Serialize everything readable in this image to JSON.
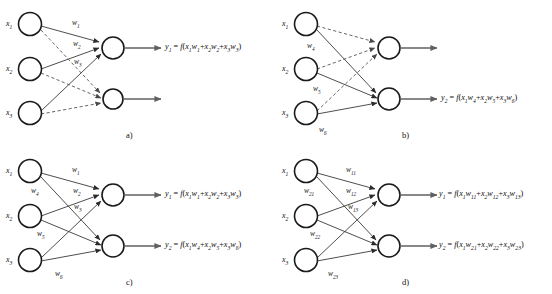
{
  "figure": {
    "background_color": "#ffffff",
    "ink_color": "#1a1a1a",
    "dashed_edge_color": "#555555",
    "solid_edge_color": "#3a3a3a",
    "output_arrow_color": "#606060"
  },
  "panels": [
    {
      "id": "a",
      "caption": "a)",
      "inputs": [
        {
          "name": "x1",
          "label": "x",
          "sub": "1"
        },
        {
          "name": "x2",
          "label": "x",
          "sub": "2"
        },
        {
          "name": "x3",
          "label": "x",
          "sub": "3"
        }
      ],
      "weights": [
        {
          "name": "w1",
          "label": "w",
          "sub": "1"
        },
        {
          "name": "w2",
          "label": "w",
          "sub": "2"
        },
        {
          "name": "w3",
          "label": "w",
          "sub": "3"
        }
      ],
      "outputs": [
        {
          "name": "y1",
          "formula_prefix": "y",
          "formula_sub": "1",
          "formula_body": " = f(x1w1+x2w2+x3w3)"
        }
      ],
      "edge_styles": {
        "to_top_node": "solid",
        "to_bottom_node": "dashed"
      }
    },
    {
      "id": "b",
      "caption": "b)",
      "inputs": [
        {
          "name": "x1",
          "label": "x",
          "sub": "1"
        },
        {
          "name": "x2",
          "label": "x",
          "sub": "2"
        },
        {
          "name": "x3",
          "label": "x",
          "sub": "3"
        }
      ],
      "weights": [
        {
          "name": "w4",
          "label": "w",
          "sub": "4"
        },
        {
          "name": "w5",
          "label": "w",
          "sub": "5"
        },
        {
          "name": "w6",
          "label": "w",
          "sub": "6"
        }
      ],
      "outputs": [
        {
          "name": "y2",
          "formula_prefix": "y",
          "formula_sub": "2",
          "formula_body": " = f(x1w4+x2w5+x3w6)"
        }
      ],
      "edge_styles": {
        "to_top_node": "dashed",
        "to_bottom_node": "solid"
      }
    },
    {
      "id": "c",
      "caption": "c)",
      "inputs": [
        {
          "name": "x1",
          "label": "x",
          "sub": "1"
        },
        {
          "name": "x2",
          "label": "x",
          "sub": "2"
        },
        {
          "name": "x3",
          "label": "x",
          "sub": "3"
        }
      ],
      "weights": [
        {
          "name": "w1",
          "label": "w",
          "sub": "1"
        },
        {
          "name": "w2",
          "label": "w",
          "sub": "2"
        },
        {
          "name": "w3",
          "label": "w",
          "sub": "3"
        },
        {
          "name": "w4",
          "label": "w",
          "sub": "4"
        },
        {
          "name": "w5",
          "label": "w",
          "sub": "5"
        },
        {
          "name": "w6",
          "label": "w",
          "sub": "6"
        }
      ],
      "outputs": [
        {
          "name": "y1",
          "formula_prefix": "y",
          "formula_sub": "1",
          "formula_body": " = f(x1w1+x2w2+x3w3)"
        },
        {
          "name": "y2",
          "formula_prefix": "y",
          "formula_sub": "2",
          "formula_body": " = f(x1w4+x2w5+x3w6)"
        }
      ],
      "edge_styles": {
        "to_top_node": "solid",
        "to_bottom_node": "solid"
      }
    },
    {
      "id": "d",
      "caption": "d)",
      "inputs": [
        {
          "name": "x1",
          "label": "x",
          "sub": "1"
        },
        {
          "name": "x2",
          "label": "x",
          "sub": "2"
        },
        {
          "name": "x3",
          "label": "x",
          "sub": "3"
        }
      ],
      "weights": [
        {
          "name": "w11",
          "label": "w",
          "sub": "11"
        },
        {
          "name": "w12",
          "label": "w",
          "sub": "12"
        },
        {
          "name": "w13",
          "label": "w",
          "sub": "13"
        },
        {
          "name": "w21",
          "label": "w",
          "sub": "21"
        },
        {
          "name": "w22",
          "label": "w",
          "sub": "22"
        },
        {
          "name": "w23",
          "label": "w",
          "sub": "23"
        }
      ],
      "outputs": [
        {
          "name": "y1",
          "formula_prefix": "y",
          "formula_sub": "1",
          "formula_body": " = f(x1w11+x2w12+x3w13)"
        },
        {
          "name": "y2",
          "formula_prefix": "y",
          "formula_sub": "2",
          "formula_body": " = f(x1w21+x2w22+x3w23)"
        }
      ],
      "edge_styles": {
        "to_top_node": "solid",
        "to_bottom_node": "solid"
      }
    }
  ],
  "labels": {
    "a": {
      "x1": "x",
      "x1s": "1",
      "x2": "x",
      "x2s": "2",
      "x3": "x",
      "x3s": "3",
      "w1": "w",
      "w1s": "1",
      "w2": "w",
      "w2s": "2",
      "w3": "w",
      "w3s": "3",
      "caption": "a)"
    },
    "b": {
      "x1": "x",
      "x1s": "1",
      "x2": "x",
      "x2s": "2",
      "x3": "x",
      "x3s": "3",
      "w4": "w",
      "w4s": "4",
      "w5": "w",
      "w5s": "5",
      "w6": "w",
      "w6s": "6",
      "caption": "b)"
    },
    "c": {
      "x1": "x",
      "x1s": "1",
      "x2": "x",
      "x2s": "2",
      "x3": "x",
      "x3s": "3",
      "w1": "w",
      "w1s": "1",
      "w2": "w",
      "w2s": "2",
      "w3": "w",
      "w3s": "3",
      "w4": "w",
      "w4s": "4",
      "w5": "w",
      "w5s": "5",
      "w6": "w",
      "w6s": "6",
      "caption": "c)"
    },
    "d": {
      "x1": "x",
      "x1s": "1",
      "x2": "x",
      "x2s": "2",
      "x3": "x",
      "x3s": "3",
      "w11": "w",
      "w11s": "11",
      "w12": "w",
      "w12s": "12",
      "w13": "w",
      "w13s": "13",
      "w21": "w",
      "w21s": "21",
      "w22": "w",
      "w22s": "22",
      "w23": "w",
      "w23s": "23",
      "caption": "d)"
    }
  }
}
